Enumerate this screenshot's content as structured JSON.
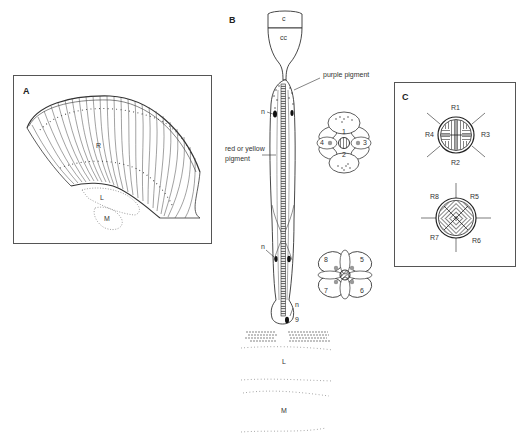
{
  "figure": {
    "panels": [
      {
        "id": "A",
        "letter": "A",
        "labels": {
          "retina": "R",
          "lamina": "L",
          "medulla": "M"
        }
      },
      {
        "id": "B",
        "letter": "B",
        "labels": {
          "cornea": "c",
          "crystalline_cone": "cc",
          "purple_pigment": "purple pigment",
          "red_yellow_pigment_line1": "red or yellow",
          "red_yellow_pigment_line2": "pigment",
          "nucleus_1": "n",
          "nucleus_2": "n",
          "nucleus_3": "n",
          "cell_9": "9",
          "lamina": "L",
          "medulla": "M"
        },
        "cross_section_upper": {
          "cells": [
            "1",
            "2",
            "3",
            "4"
          ]
        },
        "cross_section_lower": {
          "cells": [
            "5",
            "6",
            "7",
            "8"
          ]
        }
      },
      {
        "id": "C",
        "letter": "C",
        "upper_rhabdom": {
          "labels": [
            "R1",
            "R2",
            "R3",
            "R4"
          ]
        },
        "lower_rhabdom": {
          "labels": [
            "R5",
            "R6",
            "R7",
            "R8"
          ]
        }
      }
    ]
  }
}
